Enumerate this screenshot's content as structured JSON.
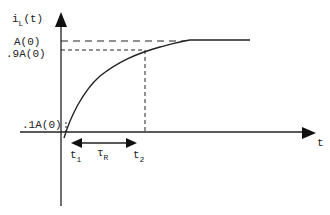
{
  "diagram": {
    "y_axis_label": "i",
    "y_axis_sub": "L",
    "y_axis_suffix": "(t)",
    "x_axis_label": "t",
    "levels": {
      "full": "A(0)",
      "ninety": ".9A(0)",
      "ten": ".1A(0)"
    },
    "times": {
      "t1": "t",
      "t1_sub": "1",
      "t2": "t",
      "t2_sub": "2",
      "rise": "τ",
      "rise_sub": "R"
    },
    "colors": {
      "ink": "#222222",
      "background": "#ffffff"
    }
  }
}
